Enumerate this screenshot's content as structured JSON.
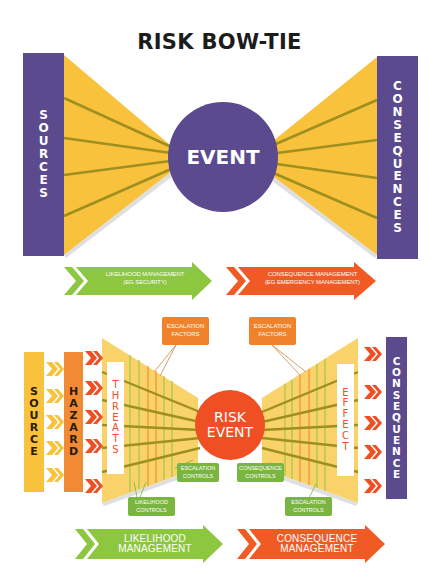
{
  "title": "RISK BOW-TIE",
  "top_diagram": {
    "left_bar": {
      "label": "SOURCES",
      "letters": [
        "S",
        "O",
        "U",
        "R",
        "C",
        "E",
        "S"
      ]
    },
    "right_bar": {
      "label": "CONSEQUENCES",
      "letters": [
        "C",
        "O",
        "N",
        "S",
        "E",
        "Q",
        "U",
        "E",
        "N",
        "C",
        "E",
        "S"
      ]
    },
    "center": "EVENT",
    "arrows": [
      {
        "line1": "LIKELIHOOD MANAGEMENT",
        "line2": "(EG SECURITY)",
        "color": "#8dc63f"
      },
      {
        "line1": "CONSEQUENCE MANAGEMENT",
        "line2": "(EG EMERGENCY MANAGEMENT)",
        "color": "#f15a24"
      }
    ],
    "colors": {
      "purple": "#5c4a8e",
      "yellow": "#f9c23c",
      "line": "#9e8f1e"
    }
  },
  "bottom_diagram": {
    "source": {
      "label": "SOURCE",
      "letters": [
        "S",
        "O",
        "U",
        "R",
        "C",
        "E"
      ]
    },
    "hazard": {
      "label": "HAZARD",
      "letters": [
        "H",
        "A",
        "Z",
        "A",
        "R",
        "D"
      ]
    },
    "threats": {
      "label": "THREATS",
      "letters": [
        "T",
        "H",
        "R",
        "E",
        "A",
        "T",
        "S"
      ]
    },
    "center": {
      "line1": "RISK",
      "line2": "EVENT"
    },
    "effect": {
      "label": "EFFECT",
      "letters": [
        "E",
        "F",
        "F",
        "E",
        "C",
        "T"
      ]
    },
    "consequence": {
      "label": "CONSEQUENCE",
      "letters": [
        "C",
        "O",
        "N",
        "S",
        "E",
        "Q",
        "U",
        "E",
        "N",
        "C",
        "E"
      ]
    },
    "escalation_factors": [
      {
        "line1": "ESCALATION",
        "line2": "FACTORS"
      },
      {
        "line1": "ESCALATION",
        "line2": "FACTORS"
      }
    ],
    "controls": [
      {
        "line1": "ESCALATION",
        "line2": "CONTROLS"
      },
      {
        "line1": "LIKELIHOOD",
        "line2": "CONTROLS"
      },
      {
        "line1": "CONSEQUENCE",
        "line2": "CONTROLS"
      },
      {
        "line1": "ESCALATION",
        "line2": "CONTROLS"
      }
    ],
    "arrows": [
      {
        "line1": "LIKELIHOOD",
        "line2": "MANAGEMENT",
        "color": "#8dc63f"
      },
      {
        "line1": "CONSEQUENCE",
        "line2": "MANAGEMENT",
        "color": "#f15a24"
      }
    ],
    "colors": {
      "source": "#f9c23c",
      "hazard": "#f08a35",
      "red": "#f04e23",
      "purple": "#5c4a8e",
      "green": "#7ab53f",
      "orange": "#f0822b"
    }
  }
}
